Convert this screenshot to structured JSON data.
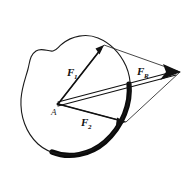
{
  "figure": {
    "background_color": "#ffffff",
    "ink_color": "#111111",
    "width": 192,
    "height": 169
  },
  "body_outline": {
    "name": "rigid-body-blob",
    "description": "irregular closed blob outline representing a rigid body",
    "stroke_color": "#1a1a1a",
    "stroke_width": 1.1,
    "shadow_color": "#0b0b0b",
    "shadow_description": "thick dark shading along lower-right edge of blob"
  },
  "point": {
    "label": "A",
    "x": 58,
    "y": 104,
    "label_x": 52,
    "label_y": 113
  },
  "vectors": [
    {
      "id": "F1",
      "label": "F",
      "subscript": "1",
      "from_x": 58,
      "from_y": 104,
      "to_x": 104,
      "to_y": 45,
      "label_x": 68,
      "label_y": 74,
      "stroke_width": 1.6,
      "description": "force F1 from point A toward upper right"
    },
    {
      "id": "F2",
      "label": "F",
      "subscript": "2",
      "from_x": 58,
      "from_y": 104,
      "to_x": 126,
      "to_y": 122,
      "label_x": 82,
      "label_y": 124,
      "stroke_width": 1.6,
      "description": "force F2 from point A toward lower right"
    },
    {
      "id": "FR",
      "label": "F",
      "subscript": "R",
      "from_x": 58,
      "from_y": 104,
      "to_x": 180,
      "to_y": 72,
      "label_x": 139,
      "label_y": 73,
      "stroke_width": 1.0,
      "description": "resultant force FR drawn as a narrow double line along the parallelogram diagonal"
    }
  ],
  "parallelogram": {
    "name": "force-parallelogram",
    "description": "construction parallelogram with vertices A, F1 tip, resultant tip, F2 tip",
    "stroke_color": "#262626",
    "stroke_width": 0.8,
    "vertices": [
      {
        "x": 58,
        "y": 104
      },
      {
        "x": 104,
        "y": 45
      },
      {
        "x": 180,
        "y": 72
      },
      {
        "x": 126,
        "y": 122
      }
    ]
  }
}
